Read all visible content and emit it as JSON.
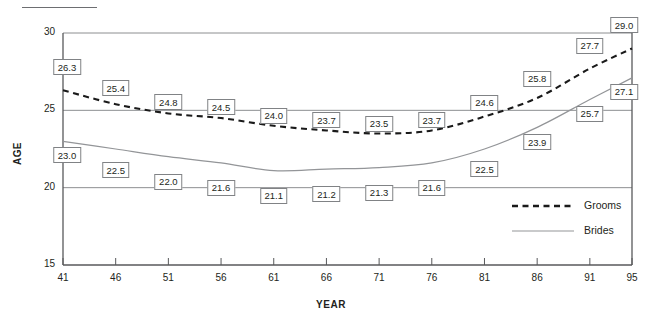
{
  "figure": {
    "top_rule_present": true,
    "background_color": "#ffffff"
  },
  "chart_data": {
    "type": "line",
    "title": "",
    "subtitle": "",
    "xlabel": "YEAR",
    "ylabel": "AGE",
    "x": [
      41,
      46,
      51,
      56,
      61,
      66,
      71,
      76,
      81,
      86,
      91,
      95
    ],
    "xtick_labels": [
      "41",
      "46",
      "51",
      "56",
      "61",
      "66",
      "71",
      "76",
      "81",
      "86",
      "91",
      "95"
    ],
    "ytick_labels": [
      "15",
      "20",
      "25",
      "30"
    ],
    "yticks": [
      15,
      20,
      25,
      30
    ],
    "ylim": [
      15,
      30
    ],
    "xlim": [
      41,
      95
    ],
    "grid": "horizontal-gridlines-at-20-25-30",
    "legend_position": "inside-lower-right",
    "series": [
      {
        "name": "Grooms",
        "style": "dashed",
        "color": "#1a1a1a",
        "label_position": "above",
        "values": [
          26.3,
          25.4,
          24.8,
          24.5,
          24.0,
          23.7,
          23.5,
          23.7,
          24.6,
          25.8,
          27.7,
          29.0
        ],
        "value_labels": [
          "26.3",
          "25.4",
          "24.8",
          "24.5",
          "24.0",
          "23.7",
          "23.5",
          "23.7",
          "24.6",
          "25.8",
          "27.7",
          "29.0"
        ]
      },
      {
        "name": "Brides",
        "style": "solid",
        "color": "#939598",
        "label_position": "below",
        "values": [
          23.0,
          22.5,
          22.0,
          21.6,
          21.1,
          21.2,
          21.3,
          21.6,
          22.5,
          23.9,
          25.7,
          27.1
        ],
        "value_labels": [
          "23.0",
          "22.5",
          "22.0",
          "21.6",
          "21.1",
          "21.2",
          "21.3",
          "21.6",
          "22.5",
          "23.9",
          "25.7",
          "27.1"
        ]
      }
    ]
  },
  "legend": {
    "entries": [
      {
        "label": "Grooms",
        "style": "dashed",
        "color": "#1a1a1a"
      },
      {
        "label": "Brides",
        "style": "solid",
        "color": "#939598"
      }
    ]
  },
  "colors": {
    "grooms_line": "#1a1a1a",
    "brides_line": "#939598",
    "axis": "#58595b",
    "gridline": "#808285",
    "label_box_border": "#808285",
    "text": "#231f20"
  }
}
